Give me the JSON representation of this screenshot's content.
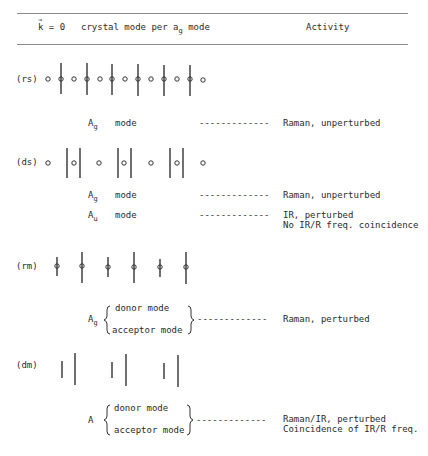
{
  "header": {
    "k_label": "k",
    "k_eq": " = 0",
    "col1_pre": "crystal mode per a",
    "col1_sub": "g",
    "col1_post": " mode",
    "col2": "Activity"
  },
  "rows": [
    {
      "label": "(rs)",
      "symmetry": [
        {
          "main": "A",
          "sub": "g",
          "mode": "mode",
          "dashes": "-------------",
          "activity": [
            "Raman, unperturbed"
          ]
        }
      ]
    },
    {
      "label": "(ds)",
      "symmetry": [
        {
          "main": "A",
          "sub": "g",
          "mode": "mode",
          "dashes": "-------------",
          "activity": [
            "Raman, unperturbed"
          ]
        },
        {
          "main": "A",
          "sub": "u",
          "mode": "mode",
          "dashes": "-------------",
          "activity": [
            "IR, perturbed",
            "No IR/R freq. coincidence"
          ]
        }
      ]
    },
    {
      "label": "(rm)",
      "symmetry": [
        {
          "main": "A",
          "sub": "g",
          "donor": "donor mode",
          "acceptor": "acceptor mode",
          "dashes": "-------------",
          "activity": [
            "Raman, perturbed"
          ]
        }
      ]
    },
    {
      "label": "(dm)",
      "symmetry": [
        {
          "main": "A",
          "sub": "",
          "donor": "donor mode",
          "acceptor": "acceptor mode",
          "dashes": "-------------",
          "activity": [
            "Raman/IR, perturbed",
            "Coincidence of IR/R freq."
          ]
        }
      ]
    }
  ],
  "colors": {
    "ink": "#2a2a2a",
    "rule": "#8a8a8a"
  }
}
